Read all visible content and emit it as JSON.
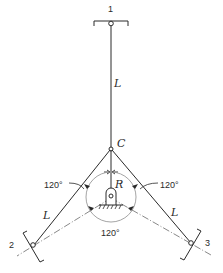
{
  "diagram": {
    "type": "three-anchor cable/link layout",
    "colors": {
      "line": "#2a2a2a",
      "circle": "#8a8a8a",
      "background": "#ffffff"
    },
    "nodes": {
      "anchor_1": {
        "label": "1"
      },
      "anchor_2": {
        "label": "2"
      },
      "anchor_3": {
        "label": "3"
      },
      "center": {
        "label": "C"
      }
    },
    "links": {
      "top": {
        "label": "L"
      },
      "left": {
        "label": "L"
      },
      "right": {
        "label": "L"
      }
    },
    "radius": {
      "label": "R"
    },
    "angles": {
      "left": "120°",
      "right": "120°",
      "bottom": "120°"
    }
  }
}
